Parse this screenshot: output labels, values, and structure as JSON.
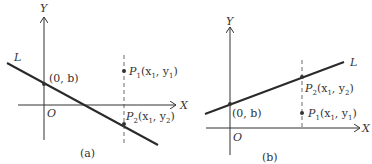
{
  "panels": [
    {
      "id": "a",
      "caption": "(a)",
      "y_axis_label": "Y",
      "x_axis_label": "X",
      "origin_label": "O",
      "line_label": "L",
      "intercept_label": "(0, b)",
      "p1": {
        "name": "P",
        "sub": "1",
        "coords": "(x",
        "xs": "1",
        "mid": ", y",
        "ys": "1",
        "end": ")"
      },
      "p2": {
        "name": "P",
        "sub": "2",
        "coords": "(x",
        "xs": "1",
        "mid": ", y",
        "ys": "2",
        "end": ")"
      }
    },
    {
      "id": "b",
      "caption": "(b)",
      "y_axis_label": "Y",
      "x_axis_label": "X",
      "origin_label": "O",
      "line_label": "L",
      "intercept_label": "(0, b)",
      "p1": {
        "name": "P",
        "sub": "1",
        "coords": "(x",
        "xs": "1",
        "mid": ", y",
        "ys": "1",
        "end": ")"
      },
      "p2": {
        "name": "P",
        "sub": "2",
        "coords": "(x",
        "xs": "1",
        "mid": ", y",
        "ys": "2",
        "end": ")"
      }
    }
  ],
  "colors": {
    "ink": "#333333",
    "line": "#2a2a2a"
  }
}
